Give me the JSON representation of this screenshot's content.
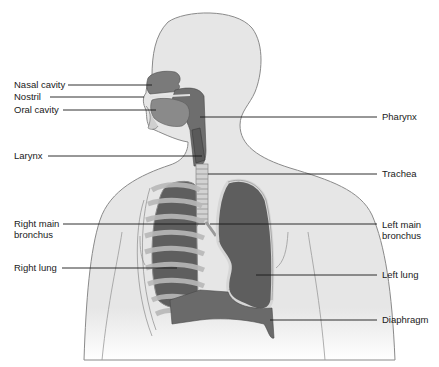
{
  "diagram": {
    "colors": {
      "body_fill": "#e6e6e6",
      "body_outline": "#8a8a8a",
      "organ_dark": "#5a5a5a",
      "organ_mid": "#7a7a7a",
      "rib_fill": "#b8b8b8",
      "trachea_fill": "#d2d2d2",
      "leader_line": "#1a1a1a",
      "label_text": "#1a1a1a"
    },
    "labels_left": [
      {
        "id": "nasal-cavity",
        "text": "Nasal cavity",
        "x": 14,
        "y": 79,
        "line_from": 68,
        "line_to": 152,
        "line_y": 85
      },
      {
        "id": "nostril",
        "text": "Nostril",
        "x": 14,
        "y": 91,
        "line_from": 50,
        "line_to": 144,
        "line_y": 97
      },
      {
        "id": "oral-cavity",
        "text": "Oral cavity",
        "x": 14,
        "y": 104,
        "line_from": 63,
        "line_to": 156,
        "line_y": 110
      },
      {
        "id": "larynx",
        "text": "Larynx",
        "x": 14,
        "y": 150,
        "line_from": 48,
        "line_to": 202,
        "line_y": 156
      },
      {
        "id": "right-main-bronchus",
        "text_line1": "Right main",
        "text_line2": "bronchus",
        "x": 14,
        "y": 218,
        "line_from": 63,
        "line_to": 205,
        "line_y": 224
      },
      {
        "id": "right-lung",
        "text": "Right lung",
        "x": 14,
        "y": 262,
        "line_from": 62,
        "line_to": 177,
        "line_y": 268
      }
    ],
    "labels_right": [
      {
        "id": "pharynx",
        "text": "Pharynx",
        "x": 382,
        "y": 110,
        "line_from": 200,
        "line_to": 377,
        "line_y": 117
      },
      {
        "id": "trachea",
        "text": "Trachea",
        "x": 382,
        "y": 167,
        "line_from": 208,
        "line_to": 377,
        "line_y": 174
      },
      {
        "id": "left-main-bronchus",
        "text_line1": "Left main",
        "text_line2": "bronchus",
        "x": 382,
        "y": 219,
        "line_from": 210,
        "line_to": 377,
        "line_y": 224
      },
      {
        "id": "left-lung",
        "text": "Left lung",
        "x": 382,
        "y": 269,
        "line_from": 256,
        "line_to": 377,
        "line_y": 275
      },
      {
        "id": "diaphragm",
        "text": "Diaphragm",
        "x": 382,
        "y": 314,
        "line_from": 270,
        "line_to": 377,
        "line_y": 320
      }
    ]
  }
}
